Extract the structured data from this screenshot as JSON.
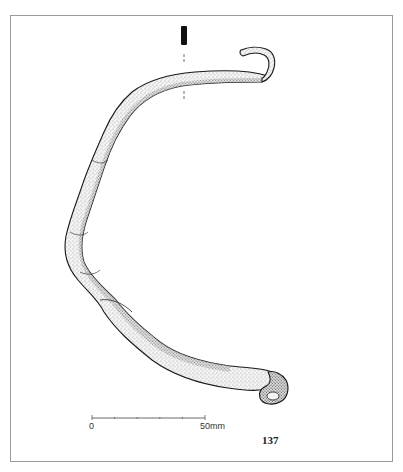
{
  "figure": {
    "number": "137"
  },
  "scale_bar": {
    "start_label": "0",
    "end_label": "50mm",
    "ticks": 6
  },
  "colors": {
    "frame": "#9a9a9a",
    "ink": "#1a1a1a",
    "section_fill": "#111111"
  }
}
